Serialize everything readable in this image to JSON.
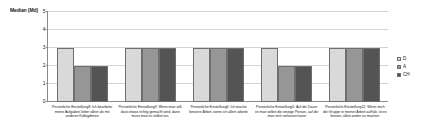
{
  "chart_data": {
    "type": "bar",
    "title": "",
    "xlabel": "",
    "ylabel": "Median (Md)",
    "ylim": [
      0,
      5
    ],
    "yticks": [
      "0",
      "1",
      "2",
      "3",
      "4",
      "5"
    ],
    "grid": true,
    "legend_position": "right",
    "categories": [
      "Persönliche Einstellung8: Ich bearbeite meine Aufgaben lieber allein als mit anderen Kollegdrinen",
      "Persönliche Einstellung9: Wenn man will, dass etwas richtig gemacht wird, dann muss man es selbst tun.",
      "Persönliche Einstellung6: Ich mache bessere Arbeit, wenn ich allein arbeite",
      "Persönliche Einstellung5: Auf die Dauer ist man selbst die einzige Person, auf die man sich verlassen kann",
      "Persönliche Einstellung12: Wenn mich die Gruppe in meiner Arbeit aufhält, ist es besser, allein weiter zu machen"
    ],
    "series": [
      {
        "name": "D",
        "color": "#d9d9d9",
        "values": [
          3,
          3,
          3,
          3,
          3
        ]
      },
      {
        "name": "A",
        "color": "#969696",
        "values": [
          2,
          3,
          3,
          2,
          3
        ]
      },
      {
        "name": "CH",
        "color": "#545454",
        "values": [
          2,
          3,
          3,
          2,
          3
        ]
      }
    ]
  },
  "legend": {
    "items": [
      {
        "label": "D"
      },
      {
        "label": "A"
      },
      {
        "label": "CH"
      }
    ]
  }
}
